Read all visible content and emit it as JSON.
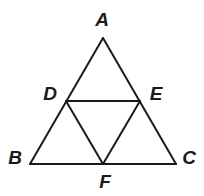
{
  "figure": {
    "background_color": "#ffffff",
    "line_color": "#1a1a1a",
    "line_width": 2,
    "label_color": "#1a1a1a",
    "canvas": {
      "width": 204,
      "height": 196
    },
    "points": [
      {
        "id": "A",
        "label": "A",
        "x": 103,
        "y": 38,
        "label_x": 102,
        "label_y": 19,
        "role": "apex-vertex"
      },
      {
        "id": "B",
        "label": "B",
        "x": 30,
        "y": 164,
        "label_x": 15,
        "label_y": 157,
        "role": "base-left-vertex"
      },
      {
        "id": "C",
        "label": "C",
        "x": 176,
        "y": 164,
        "label_x": 189,
        "label_y": 157,
        "role": "base-right-vertex"
      },
      {
        "id": "D",
        "label": "D",
        "x": 66,
        "y": 101,
        "label_x": 50,
        "label_y": 93,
        "role": "midpoint-AB"
      },
      {
        "id": "E",
        "label": "E",
        "x": 140,
        "y": 101,
        "label_x": 156,
        "label_y": 93,
        "role": "midpoint-AC"
      },
      {
        "id": "F",
        "label": "F",
        "x": 103,
        "y": 164,
        "label_x": 105,
        "label_y": 181,
        "role": "midpoint-BC"
      }
    ],
    "segments": [
      {
        "id": "AB",
        "from": "A",
        "to": "B",
        "x1": 103,
        "y1": 38,
        "x2": 30,
        "y2": 164,
        "kind": "outer-side"
      },
      {
        "id": "AC",
        "from": "A",
        "to": "C",
        "x1": 103,
        "y1": 38,
        "x2": 176,
        "y2": 164,
        "kind": "outer-side"
      },
      {
        "id": "BC",
        "from": "B",
        "to": "C",
        "x1": 30,
        "y1": 164,
        "x2": 176,
        "y2": 164,
        "kind": "outer-base"
      },
      {
        "id": "DE",
        "from": "D",
        "to": "E",
        "x1": 66,
        "y1": 101,
        "x2": 140,
        "y2": 101,
        "kind": "midsegment"
      },
      {
        "id": "DF",
        "from": "D",
        "to": "F",
        "x1": 66,
        "y1": 101,
        "x2": 103,
        "y2": 164,
        "kind": "midsegment"
      },
      {
        "id": "EF",
        "from": "E",
        "to": "F",
        "x1": 140,
        "y1": 101,
        "x2": 103,
        "y2": 164,
        "kind": "midsegment"
      }
    ]
  }
}
